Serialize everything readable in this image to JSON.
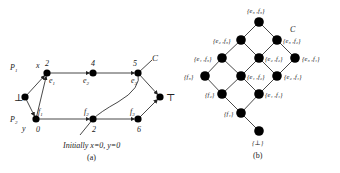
{
  "figure_a": {
    "caption": "(a)",
    "initial_text": "Initially x=0, y=0",
    "process_labels": [
      {
        "text": "P",
        "sub": "1",
        "x": 10,
        "y": 70
      },
      {
        "text": "P",
        "sub": "2",
        "x": 10,
        "y": 122
      }
    ],
    "variable_labels": [
      {
        "text": "x",
        "x": 36,
        "y": 68
      },
      {
        "text": "y",
        "x": 22,
        "y": 131
      }
    ],
    "nodes": [
      {
        "id": "bottom",
        "label": "⊥",
        "x": 25,
        "y": 97,
        "lx": 14,
        "ly": 101
      },
      {
        "id": "e1",
        "label": "e",
        "sub": "1",
        "x": 47,
        "y": 73,
        "lx": 49,
        "ly": 83,
        "value": "2",
        "vx": 45,
        "vy": 66
      },
      {
        "id": "e2",
        "label": "e",
        "sub": "2",
        "x": 93,
        "y": 73,
        "lx": 83,
        "ly": 83,
        "value": "4",
        "vx": 91,
        "vy": 66
      },
      {
        "id": "e3",
        "label": "e",
        "sub": "3",
        "x": 138,
        "y": 73,
        "lx": 131,
        "ly": 83,
        "value": "5",
        "vx": 133,
        "vy": 66
      },
      {
        "id": "f1",
        "label": "f",
        "sub": "1",
        "x": 36,
        "y": 119,
        "lx": 38,
        "ly": 114,
        "value": "0",
        "vx": 36,
        "vy": 132
      },
      {
        "id": "f2",
        "label": "f",
        "sub": "2",
        "x": 93,
        "y": 119,
        "lx": 84,
        "ly": 114,
        "value": "2",
        "vx": 92,
        "vy": 132
      },
      {
        "id": "f3",
        "label": "f",
        "sub": "3",
        "x": 138,
        "y": 119,
        "lx": 130,
        "ly": 114,
        "value": "6",
        "vx": 137,
        "vy": 132
      },
      {
        "id": "top",
        "label": "⊤",
        "x": 160,
        "y": 97,
        "lx": 166,
        "ly": 101
      }
    ],
    "edges": [
      [
        "bottom",
        "e1"
      ],
      [
        "bottom",
        "f1"
      ],
      [
        "f1",
        "e1"
      ],
      [
        "e1",
        "e2"
      ],
      [
        "e2",
        "e3"
      ],
      [
        "e3",
        "top"
      ],
      [
        "f1",
        "f2"
      ],
      [
        "f2",
        "f3"
      ],
      [
        "f3",
        "top"
      ]
    ],
    "cut_label": "C"
  },
  "figure_b": {
    "caption": "(b)",
    "cut_label": "C",
    "nodes": [
      {
        "id": "n13",
        "label": "{e₃ ,f₃}",
        "x": 259,
        "y": 22,
        "lx": 247,
        "ly": 13
      },
      {
        "id": "n12",
        "label": "{e₂ ,f₃}",
        "x": 241,
        "y": 40,
        "lx": 213,
        "ly": 43
      },
      {
        "id": "n11",
        "label": "{e₃ ,f₂}",
        "x": 277,
        "y": 40,
        "lx": 283,
        "ly": 43
      },
      {
        "id": "n9",
        "label": "{e₁ ,f₃}",
        "x": 222,
        "y": 58,
        "lx": 194,
        "ly": 61
      },
      {
        "id": "n8",
        "label": "{e₂ ,f₂}",
        "x": 259,
        "y": 58,
        "lx": 265,
        "ly": 61
      },
      {
        "id": "n10",
        "label": "{e₃ ,f₁}",
        "x": 295,
        "y": 58,
        "lx": 302,
        "ly": 61
      },
      {
        "id": "n5",
        "label": "{f₃}",
        "x": 205,
        "y": 76,
        "lx": 184,
        "ly": 79
      },
      {
        "id": "n6",
        "label": "{e₁ ,f₂}",
        "x": 241,
        "y": 76,
        "lx": 247,
        "ly": 79
      },
      {
        "id": "n7",
        "label": "{e₂ ,f₁}",
        "x": 277,
        "y": 76,
        "lx": 284,
        "ly": 79
      },
      {
        "id": "n3",
        "label": "{f₂}",
        "x": 222,
        "y": 94,
        "lx": 205,
        "ly": 97
      },
      {
        "id": "n4",
        "label": "{e₁ ,f₁}",
        "x": 259,
        "y": 94,
        "lx": 265,
        "ly": 97
      },
      {
        "id": "n2",
        "label": "{f₁}",
        "x": 241,
        "y": 113,
        "lx": 224,
        "ly": 116
      },
      {
        "id": "n1",
        "label": "{⊥}",
        "x": 259,
        "y": 131,
        "lx": 252,
        "ly": 145
      }
    ],
    "edges": [
      [
        "n13",
        "n12"
      ],
      [
        "n13",
        "n11"
      ],
      [
        "n12",
        "n9"
      ],
      [
        "n12",
        "n8"
      ],
      [
        "n11",
        "n8"
      ],
      [
        "n11",
        "n10"
      ],
      [
        "n9",
        "n5"
      ],
      [
        "n9",
        "n6"
      ],
      [
        "n8",
        "n6"
      ],
      [
        "n8",
        "n7"
      ],
      [
        "n10",
        "n7"
      ],
      [
        "n5",
        "n3"
      ],
      [
        "n6",
        "n3"
      ],
      [
        "n6",
        "n4"
      ],
      [
        "n7",
        "n4"
      ],
      [
        "n3",
        "n2"
      ],
      [
        "n4",
        "n2"
      ],
      [
        "n2",
        "n1"
      ]
    ]
  }
}
